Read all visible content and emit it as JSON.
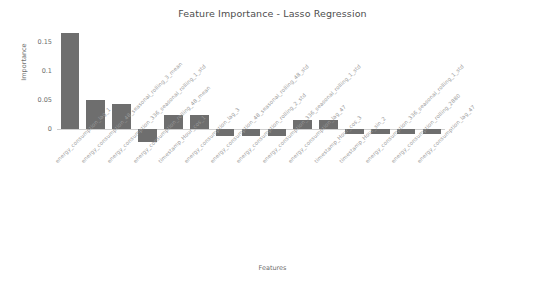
{
  "chart_data": {
    "type": "bar",
    "title": "Feature Importance - Lasso Regression",
    "xlabel": "Features",
    "ylabel": "Importance",
    "ylim": [
      -0.03,
      0.175
    ],
    "yticks": [
      "0",
      "0.05",
      "0.1",
      "0.15"
    ],
    "ytick_values": [
      0,
      0.05,
      0.1,
      0.15
    ],
    "grid": false,
    "legend": null,
    "bar_color": "#6e6e6e",
    "categories": [
      "energy_consumption_lag_1",
      "energy_consumption_48_seasonal_rolling_3_mean",
      "energy_consumption_336_seasonal_rolling_1_std",
      "energy_consumption_rolling_48_mean",
      "timestamp_Hour_cos_1",
      "energy_consumption_lag_3",
      "energy_consumption_48_seasonal_rolling_48_std",
      "energy_consumption_rolling_2_std",
      "energy_consumption_336_seasonal_rolling_1_std",
      "energy_consumption_lag_47",
      "timestamp_Hour_cos_3",
      "timestamp_Hour_sin_2",
      "energy_consumption_336_seasonal_rolling_1_std",
      "energy_consumption_rolling_2880",
      "energy_consumption_lag_47"
    ],
    "values": [
      0.165,
      0.05,
      0.043,
      -0.022,
      0.024,
      0.024,
      -0.011,
      -0.011,
      -0.011,
      0.016,
      0.016,
      -0.007,
      -0.007,
      -0.007,
      -0.007
    ]
  }
}
